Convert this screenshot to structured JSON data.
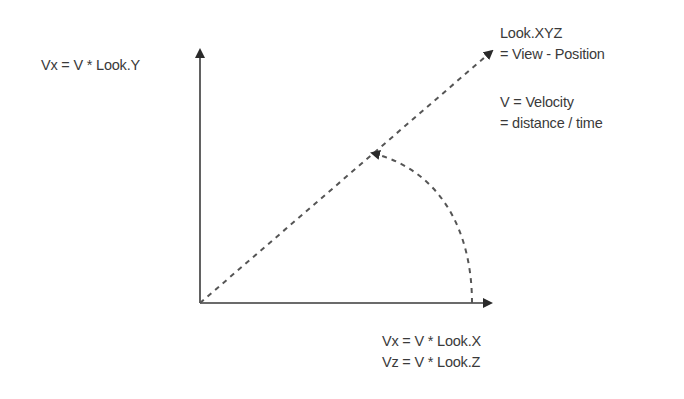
{
  "diagram": {
    "labels": {
      "y_axis": "Vx = V * Look.Y",
      "look_title": "Look.XYZ",
      "look_def": "= View - Position",
      "velocity_title": "V = Velocity",
      "velocity_def": "= distance / time",
      "x_axis_line1": "Vx = V * Look.X",
      "x_axis_line2": "Vz = V * Look.Z"
    },
    "colors": {
      "axis": "#3a3a3a",
      "dashed": "#555555",
      "text": "#3a3a3a"
    }
  }
}
